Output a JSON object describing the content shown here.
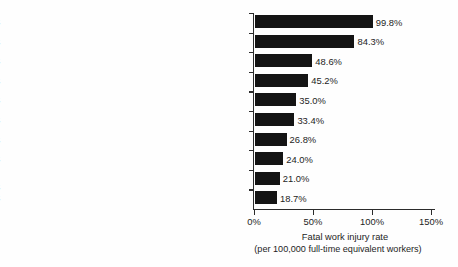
{
  "chart_data": {
    "type": "bar",
    "orientation": "horizontal",
    "title": "",
    "xlabel": "Fatal work injury rate",
    "xlabel_sub": "(per 100,000 full-time equivalent workers)",
    "ylabel": "",
    "xlim": [
      0,
      150
    ],
    "grid": false,
    "legend": "none",
    "xticks": [
      0,
      50,
      100,
      150
    ],
    "xtick_labels": [
      "0%",
      "50%",
      "100%",
      "150%"
    ],
    "categories": [
      "Fishers and related fishing workers",
      "Logging workers",
      "Aircraft pilots and flight engineers",
      "Roofers",
      "Refuse and recyclable material collectors",
      "Structural iron and steel workers",
      "Driver/sales workers and truck drivers",
      "Farmers, ranchers, and other agricultural managers",
      "First-line supervisors of landscaping, lawn\nservice, and groundskeeping workers",
      "Electrical power-line installers and repairers"
    ],
    "values": [
      99.8,
      84.3,
      48.6,
      45.2,
      35.0,
      33.4,
      26.8,
      24.0,
      21.0,
      18.7
    ],
    "value_labels": [
      "99.8%",
      "84.3%",
      "48.6%",
      "45.2%",
      "35.0%",
      "33.4%",
      "26.8%",
      "24.0%",
      "21.0%",
      "18.7%"
    ],
    "bar_color": "#141414",
    "axis_color": "#2b2b2b",
    "background_color": "#fefefe",
    "text_color": "#1d1d1d"
  }
}
